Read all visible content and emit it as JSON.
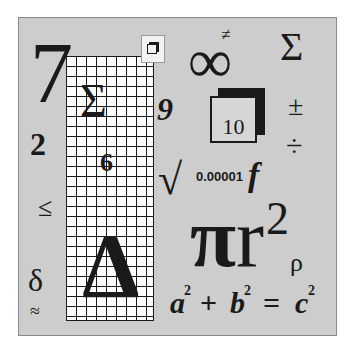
{
  "symbols": {
    "seven": "7",
    "sigma_grid": "Σ",
    "nine": "9",
    "two": "2",
    "six": "6",
    "leq": "≤",
    "delta_upper": "Δ",
    "delta_lower": "δ",
    "approx": "≈",
    "neq": "≠",
    "infinity": "∞",
    "sigma_right": "Σ",
    "ten": "10",
    "plusminus": "±",
    "divide": "÷",
    "sqrt": "√",
    "small_number": "0.00001",
    "f": "f",
    "pi": "π",
    "r": "r",
    "r_exp": "2",
    "rho": "ρ",
    "eq_a": "a",
    "eq_a_exp": "2",
    "eq_plus": "+",
    "eq_b": "b",
    "eq_b_exp": "2",
    "eq_equals": "=",
    "eq_c": "c",
    "eq_c_exp": "2"
  },
  "colors": {
    "panel": "#cdcdcd",
    "ink": "#1a1a1a",
    "background": "#ffffff"
  }
}
